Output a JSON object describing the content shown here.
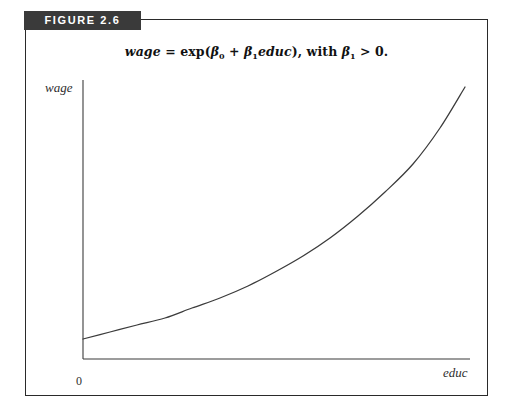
{
  "figure": {
    "banner_label": "FIGURE 2.6",
    "banner_color": "#3a3a3a",
    "banner_text_color": "#ffffff",
    "frame_color": "#2a2a2a",
    "background_color": "#ffffff"
  },
  "equation": {
    "lhs": "wage",
    "equals": "=",
    "exp_open": "exp(",
    "beta": "β",
    "beta0_sub": "0",
    "beta1_sub": "1",
    "plus": "+",
    "regressor": "educ",
    "close_paren": "),",
    "with": "with",
    "gt": ">",
    "zero_period": "0.",
    "full_text": "wage = exp(β₀ + β₁educ), with β₁ > 0."
  },
  "axes": {
    "y_label": "wage",
    "x_label": "educ",
    "origin_label": "0",
    "axis_color": "#3b3b3b",
    "label_color": "#2e2e2e"
  },
  "chart_data": {
    "type": "line",
    "subtitle": "",
    "xlabel": "educ",
    "ylabel": "wage",
    "grid": false,
    "legend": null,
    "legend_position": "none",
    "axis_ticks_x": [
      "0"
    ],
    "axis_ticks_y": [],
    "xlim": [
      0,
      10
    ],
    "ylim": [
      0,
      7.2
    ],
    "annotations": [
      "0"
    ],
    "series": [
      {
        "name": "wage = exp(b0 + b1*educ)",
        "color": "#3b3b3b",
        "x": [
          0.0,
          0.5,
          1.0,
          1.5,
          2.0,
          2.5,
          3.0,
          3.5,
          4.0,
          4.5,
          5.0,
          5.5,
          6.0,
          6.5,
          7.0,
          7.5,
          8.0,
          8.5,
          9.0,
          9.5,
          10.0
        ],
        "y": [
          0.6,
          0.65,
          0.71,
          0.77,
          0.84,
          0.92,
          1.0,
          1.09,
          1.19,
          1.3,
          1.42,
          1.55,
          1.7,
          1.86,
          2.03,
          2.22,
          2.43,
          2.66,
          2.91,
          3.18,
          3.48
        ]
      }
    ],
    "curve_pixel_path": [
      [
        83,
        339
      ],
      [
        110,
        332
      ],
      [
        137,
        325
      ],
      [
        165,
        318
      ],
      [
        192,
        308
      ],
      [
        220,
        298
      ],
      [
        248,
        286
      ],
      [
        275,
        272
      ],
      [
        303,
        256
      ],
      [
        330,
        238
      ],
      [
        358,
        216
      ],
      [
        385,
        192
      ],
      [
        413,
        164
      ],
      [
        440,
        128
      ],
      [
        465,
        87
      ]
    ]
  }
}
